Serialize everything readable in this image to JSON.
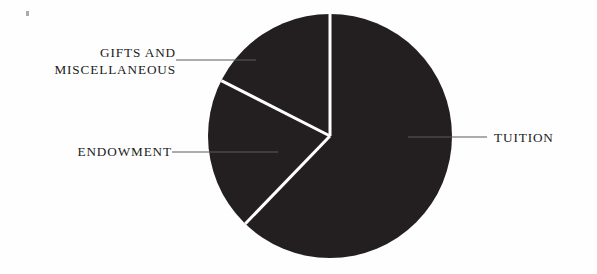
{
  "figure": {
    "background_color": "#fefefe",
    "slice_color": "#231f20",
    "separator_color": "#ffffff",
    "leader_color": "#5a5a5a",
    "text_color": "#1a1a1a",
    "corner_mark": {
      "name": "scan-artifact-mark",
      "color": "#8d8d8d"
    }
  },
  "labels": {
    "gifts_line1": "GIFTS AND",
    "gifts_line2": "MISCELLANEOUS",
    "endowment": "ENDOWMENT",
    "tuition": "TUITION"
  },
  "chart_data": {
    "type": "pie",
    "title": "",
    "subtitle": "",
    "xlabel": "",
    "ylabel": "",
    "legend_position": "none",
    "grid": false,
    "labels_shown": true,
    "values_shown": false,
    "center": [
      330,
      136
    ],
    "radius": 122,
    "start_angle_deg": 0,
    "direction": "clockwise",
    "categories": [
      "TUITION",
      "ENDOWMENT",
      "GIFTS AND MISCELLANEOUS"
    ],
    "values": [
      62,
      20,
      18
    ],
    "units": "percent",
    "slices": [
      {
        "name": "TUITION",
        "value": 62,
        "start_angle_deg": 0,
        "end_angle_deg": 224,
        "color": "#231f20",
        "label_side": "right"
      },
      {
        "name": "ENDOWMENT",
        "value": 20,
        "start_angle_deg": 224,
        "end_angle_deg": 297,
        "color": "#231f20",
        "label_side": "left"
      },
      {
        "name": "GIFTS AND MISCELLANEOUS",
        "value": 18,
        "start_angle_deg": 297,
        "end_angle_deg": 360,
        "color": "#231f20",
        "label_side": "left"
      }
    ]
  }
}
